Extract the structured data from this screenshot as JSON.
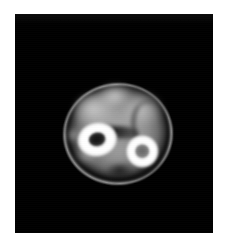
{
  "page": {
    "background_color": "#ffffff",
    "width": 229,
    "height": 250
  },
  "viewer": {
    "name": "medical-image-viewer",
    "background_color": "#000000",
    "x": 15,
    "y": 14,
    "width": 198,
    "height": 219,
    "overlay_text": "",
    "annotations": []
  },
  "scan": {
    "modality": "cross-sectional-tomographic-slice",
    "orientation": "axial",
    "description": "Axial cross-section of a limb showing two bright cortical bones within a soft-tissue mass on a black background",
    "colormap": "grayscale",
    "bounds": {
      "x": 62,
      "y": 82,
      "width": 112,
      "height": 104
    },
    "rotation_deg": -4,
    "structures": [
      {
        "id": "skin-rim",
        "label": "skin / outer fascia rim",
        "intensity": "bright-thin-line",
        "color": "#b0b0b0"
      },
      {
        "id": "subcutaneous-layer",
        "label": "subcutaneous fat layer",
        "intensity": "dark",
        "color": "#080808"
      },
      {
        "id": "soft-tissue",
        "label": "muscle / soft tissue mass",
        "intensity": "mid-grey",
        "color": "#9e9e9e"
      },
      {
        "id": "interosseous-space",
        "label": "interosseous dark band",
        "intensity": "very-dark",
        "color": "#101010"
      },
      {
        "id": "bone-anterolateral",
        "label": "large cortical bone (left)",
        "intensity": "very-bright-ring",
        "color": "#ffffff",
        "marrow_color": "#1a1a1a",
        "center": {
          "x": 91,
          "y": 133
        },
        "diameter": 42
      },
      {
        "id": "bone-posteromedial",
        "label": "small cortical bone (right)",
        "intensity": "very-bright-ring",
        "color": "#ffffff",
        "marrow_color": "#777777",
        "center": {
          "x": 131,
          "y": 153
        },
        "diameter": 34
      }
    ]
  }
}
